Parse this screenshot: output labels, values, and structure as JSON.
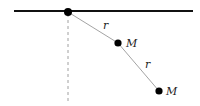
{
  "diagram": {
    "type": "double pendulum",
    "colors": {
      "ceiling": "#111111",
      "rod": "#999999",
      "mass": "#000000",
      "guide": "#888888"
    },
    "ceiling": {
      "x1": 14,
      "y1": 11,
      "x2": 193,
      "y2": 11
    },
    "pivot": {
      "x": 68,
      "y": 12
    },
    "masses": [
      {
        "x": 118,
        "y": 43,
        "label": "M"
      },
      {
        "x": 159,
        "y": 91,
        "label": "M"
      }
    ],
    "rods": [
      {
        "label": "r",
        "label_x": 103,
        "label_y": 29
      },
      {
        "label": "r",
        "label_x": 145,
        "label_y": 68
      }
    ],
    "vertical_reference": {
      "x": 68,
      "y1": 14,
      "y2": 104,
      "style": "dashed"
    }
  }
}
